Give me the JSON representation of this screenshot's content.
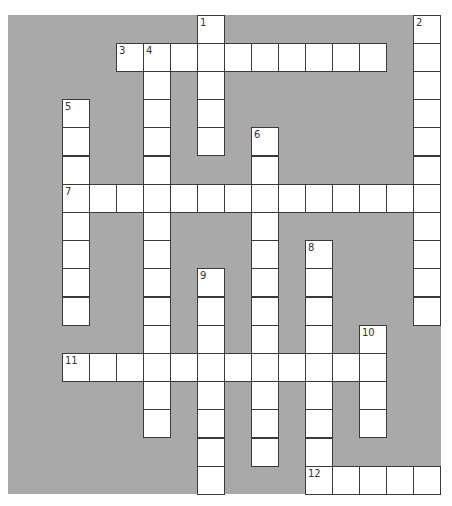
{
  "puzzle": {
    "type": "crossword",
    "grid": {
      "columns": 16,
      "rows": 17,
      "origin_x": 8,
      "origin_y": 14.5,
      "cell_width": 27,
      "cell_height": 28.2
    },
    "colors": {
      "background": "#a9a9a9",
      "cell": "#ffffff",
      "border": "#3a3a3a",
      "number": "#333333"
    },
    "words": [
      {
        "number": "1",
        "direction": "down",
        "row": 0,
        "col": 7,
        "length": 5
      },
      {
        "number": "2",
        "direction": "down",
        "row": 0,
        "col": 15,
        "length": 11
      },
      {
        "number": "3",
        "direction": "across",
        "row": 1,
        "col": 4,
        "length": 10
      },
      {
        "number": "4",
        "direction": "down",
        "row": 1,
        "col": 5,
        "length": 14
      },
      {
        "number": "5",
        "direction": "down",
        "row": 3,
        "col": 2,
        "length": 8
      },
      {
        "number": "6",
        "direction": "down",
        "row": 4,
        "col": 9,
        "length": 12
      },
      {
        "number": "7",
        "direction": "across",
        "row": 6,
        "col": 2,
        "length": 14
      },
      {
        "number": "8",
        "direction": "down",
        "row": 8,
        "col": 11,
        "length": 9
      },
      {
        "number": "9",
        "direction": "down",
        "row": 9,
        "col": 7,
        "length": 8
      },
      {
        "number": "10",
        "direction": "down",
        "row": 11,
        "col": 13,
        "length": 4
      },
      {
        "number": "11",
        "direction": "across",
        "row": 12,
        "col": 2,
        "length": 12
      },
      {
        "number": "12",
        "direction": "across",
        "row": 16,
        "col": 11,
        "length": 5
      }
    ]
  }
}
